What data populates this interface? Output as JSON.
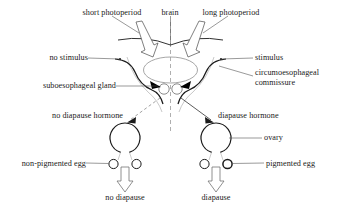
{
  "diagram": {
    "ink_color": "#1a1a1a",
    "labels": {
      "short_photoperiod": "short photoperiod",
      "brain": "brain",
      "long_photoperiod": "long photoperiod",
      "no_stimulus": "no stimulus",
      "stimulus": "stimulus",
      "suboesophageal_gland": "suboesophageal gland",
      "circumoesophageal_commissure_line1": "circumoesophageal",
      "circumoesophageal_commissure_line2": "commissure",
      "no_diapause_hormone": "no diapause hormone",
      "diapause_hormone": "diapause hormone",
      "ovary": "ovary",
      "non_pigmented_egg": "non-pigmented egg",
      "pigmented_egg": "pigmented egg",
      "no_diapause": "no diapause",
      "diapause": "diapause"
    }
  }
}
